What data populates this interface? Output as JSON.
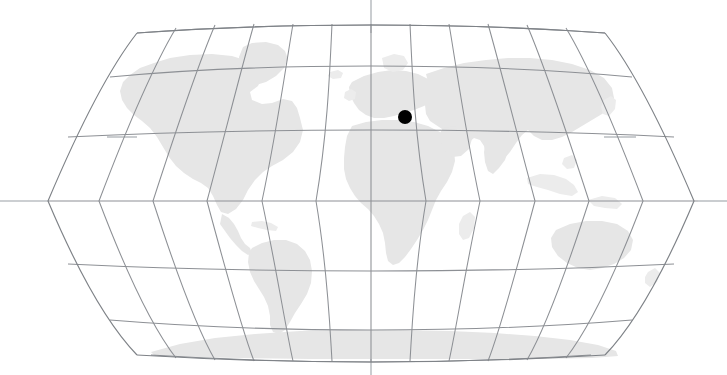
{
  "map": {
    "title": "World Map",
    "projection": "robinson",
    "background_color": "#ffffff",
    "land_color": "#e6e6e6",
    "graticule_color": "#8d9095",
    "outline_color": "#7e8287",
    "marker_color": "#000000",
    "graticule": {
      "meridian_interval_degrees": 30,
      "parallel_interval_degrees": 30,
      "central_meridian_degrees": 0,
      "meridian_labels": [
        "180W",
        "150W",
        "120W",
        "90W",
        "60W",
        "30W",
        "0",
        "30E",
        "60E",
        "90E",
        "120E",
        "150E",
        "180E"
      ],
      "parallel_labels": [
        "75N",
        "60N",
        "30N",
        "0",
        "30S",
        "60S",
        "75S"
      ],
      "equator_extends_beyond_globe": true,
      "central_meridian_extends_beyond_globe": true
    },
    "marker": {
      "name": "location-marker",
      "shape": "filled-circle",
      "radius_px": 7,
      "x_px": 405,
      "y_px": 117,
      "region": "Mediterranean / Southern Europe"
    },
    "landmasses": [
      {
        "name": "north-america"
      },
      {
        "name": "south-america"
      },
      {
        "name": "greenland"
      },
      {
        "name": "europe"
      },
      {
        "name": "africa"
      },
      {
        "name": "asia"
      },
      {
        "name": "australia"
      },
      {
        "name": "antarctica"
      },
      {
        "name": "madagascar"
      },
      {
        "name": "new-zealand"
      },
      {
        "name": "japan"
      },
      {
        "name": "british-isles"
      },
      {
        "name": "iceland"
      },
      {
        "name": "indonesia"
      },
      {
        "name": "caribbean"
      }
    ]
  }
}
